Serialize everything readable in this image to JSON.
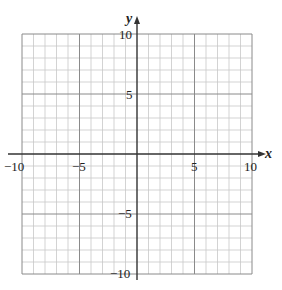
{
  "chart_data": {
    "type": "scatter",
    "title": "",
    "xlabel": "x",
    "ylabel": "y",
    "xlim": [
      -10,
      10
    ],
    "ylim": [
      -10,
      10
    ],
    "grid": true,
    "grid_minor_step": 1,
    "grid_major_step": 5,
    "x_ticks": [
      -10,
      -5,
      5,
      10
    ],
    "y_ticks": [
      10,
      5,
      -5,
      -10
    ],
    "x_tick_labels": [
      "−10",
      "−5",
      "5",
      "10"
    ],
    "y_tick_labels": [
      "10",
      "5",
      "−5",
      "−10"
    ],
    "series": [],
    "legend": null
  },
  "labels": {
    "x_axis": "x",
    "y_axis": "y",
    "x_neg10": "−10",
    "x_neg5": "−5",
    "x_5": "5",
    "x_10": "10",
    "y_10": "10",
    "y_5": "5",
    "y_neg5": "−5",
    "y_neg10": "−10"
  },
  "colors": {
    "minor_grid": "#c8c8c8",
    "major_grid": "#8a8a8a",
    "axis": "#333333"
  }
}
